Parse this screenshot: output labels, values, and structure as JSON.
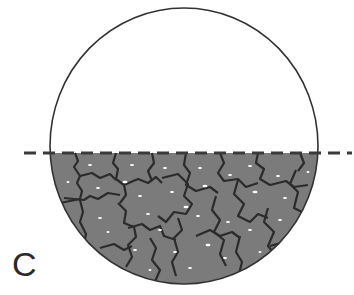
{
  "figure": {
    "panel_label": "C",
    "circle": {
      "cx": 184,
      "cy": 146,
      "rx": 134,
      "ry": 138,
      "stroke": "#333333"
    },
    "dashed_line": {
      "y": 153,
      "x1": 24,
      "x2": 352,
      "color": "#3a3a3a"
    },
    "fill": {
      "color": "#7b7b7b",
      "boundary_color": "#2b2b2b",
      "speckle_color": "#ffffff"
    }
  }
}
